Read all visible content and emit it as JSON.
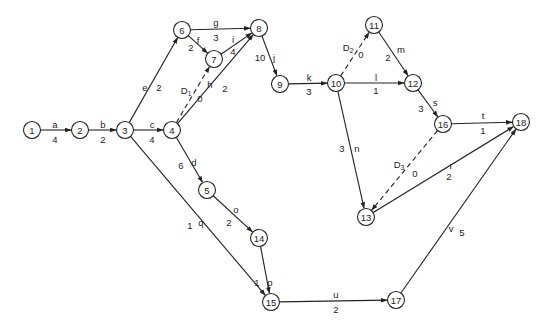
{
  "diagram": {
    "type": "activity-on-arrow network",
    "nodes": [
      {
        "id": "1",
        "label": "1",
        "x": 32,
        "y": 130
      },
      {
        "id": "2",
        "label": "2",
        "x": 80,
        "y": 130
      },
      {
        "id": "3",
        "label": "3",
        "x": 125,
        "y": 130
      },
      {
        "id": "4",
        "label": "4",
        "x": 172,
        "y": 130
      },
      {
        "id": "5",
        "label": "5",
        "x": 207,
        "y": 190
      },
      {
        "id": "6",
        "label": "6",
        "x": 182,
        "y": 30
      },
      {
        "id": "7",
        "label": "7",
        "x": 214,
        "y": 59
      },
      {
        "id": "8",
        "label": "8",
        "x": 259,
        "y": 28
      },
      {
        "id": "9",
        "label": "9",
        "x": 280,
        "y": 84
      },
      {
        "id": "10",
        "label": "10",
        "x": 336,
        "y": 83
      },
      {
        "id": "11",
        "label": "11",
        "x": 374,
        "y": 25
      },
      {
        "id": "12",
        "label": "12",
        "x": 413,
        "y": 83
      },
      {
        "id": "13",
        "label": "13",
        "x": 366,
        "y": 217
      },
      {
        "id": "14",
        "label": "14",
        "x": 259,
        "y": 238
      },
      {
        "id": "15",
        "label": "15",
        "x": 271,
        "y": 302
      },
      {
        "id": "16",
        "label": "16",
        "x": 443,
        "y": 124
      },
      {
        "id": "17",
        "label": "17",
        "x": 396,
        "y": 300
      },
      {
        "id": "18",
        "label": "18",
        "x": 521,
        "y": 122
      }
    ],
    "edges": [
      {
        "from": "1",
        "to": "2",
        "activity": "a",
        "duration": "4",
        "dummy": false,
        "ax": 55,
        "ay": 124,
        "dx": 55,
        "dy": 139
      },
      {
        "from": "2",
        "to": "3",
        "activity": "b",
        "duration": "2",
        "dummy": false,
        "ax": 103,
        "ay": 124,
        "dx": 103,
        "dy": 139
      },
      {
        "from": "3",
        "to": "4",
        "activity": "c",
        "duration": "4",
        "dummy": false,
        "ax": 152,
        "ay": 124,
        "dx": 152,
        "dy": 139
      },
      {
        "from": "4",
        "to": "5",
        "activity": "d",
        "duration": "6",
        "dummy": false,
        "ax": 194,
        "ay": 162,
        "dx": 181,
        "dy": 165
      },
      {
        "from": "3",
        "to": "6",
        "activity": "e",
        "duration": "2",
        "dummy": false,
        "ax": 145,
        "ay": 87,
        "dx": 159,
        "dy": 87
      },
      {
        "from": "6",
        "to": "7",
        "activity": "f",
        "duration": "2",
        "dummy": false,
        "ax": 198,
        "ay": 40,
        "dx": 191,
        "dy": 47
      },
      {
        "from": "6",
        "to": "8",
        "activity": "g",
        "duration": "3",
        "dummy": false,
        "ax": 216,
        "ay": 22,
        "dx": 216,
        "dy": 37
      },
      {
        "from": "4",
        "to": "8",
        "activity": "h",
        "duration": "2",
        "dummy": false,
        "ax": 210,
        "ay": 84,
        "dx": 225,
        "dy": 88
      },
      {
        "from": "7",
        "to": "8",
        "activity": "i",
        "duration": "4",
        "dummy": false,
        "ax": 233,
        "ay": 39,
        "dx": 233,
        "dy": 51
      },
      {
        "from": "8",
        "to": "9",
        "activity": "j",
        "duration": "10",
        "dummy": false,
        "ax": 274,
        "ay": 57,
        "dx": 260,
        "dy": 57
      },
      {
        "from": "9",
        "to": "10",
        "activity": "k",
        "duration": "3",
        "dummy": false,
        "ax": 309,
        "ay": 77,
        "dx": 309,
        "dy": 91
      },
      {
        "from": "10",
        "to": "12",
        "activity": "l",
        "duration": "1",
        "dummy": false,
        "ax": 376,
        "ay": 77,
        "dx": 376,
        "dy": 90
      },
      {
        "from": "11",
        "to": "12",
        "activity": "m",
        "duration": "2",
        "dummy": false,
        "ax": 401,
        "ay": 49,
        "dx": 388,
        "dy": 57
      },
      {
        "from": "10",
        "to": "13",
        "activity": "n",
        "duration": "3",
        "dummy": false,
        "ax": 357,
        "ay": 148,
        "dx": 342,
        "dy": 148
      },
      {
        "from": "5",
        "to": "14",
        "activity": "o",
        "duration": "2",
        "dummy": false,
        "ax": 236,
        "ay": 209,
        "dx": 229,
        "dy": 222
      },
      {
        "from": "14",
        "to": "15",
        "activity": "p",
        "duration": "1",
        "dummy": false,
        "ax": 270,
        "ay": 282,
        "dx": 257,
        "dy": 282
      },
      {
        "from": "3",
        "to": "15",
        "activity": "q",
        "duration": "1",
        "dummy": false,
        "ax": 201,
        "ay": 222,
        "dx": 190,
        "dy": 225
      },
      {
        "from": "13",
        "to": "18",
        "activity": "r",
        "duration": "2",
        "dummy": false,
        "ax": 451,
        "ay": 165,
        "dx": 449,
        "dy": 176
      },
      {
        "from": "12",
        "to": "16",
        "activity": "s",
        "duration": "3",
        "dummy": false,
        "ax": 435,
        "ay": 102,
        "dx": 421,
        "dy": 108
      },
      {
        "from": "16",
        "to": "18",
        "activity": "t",
        "duration": "1",
        "dummy": false,
        "ax": 483,
        "ay": 115,
        "dx": 483,
        "dy": 130
      },
      {
        "from": "15",
        "to": "17",
        "activity": "u",
        "duration": "2",
        "dummy": false,
        "ax": 336,
        "ay": 294,
        "dx": 336,
        "dy": 309
      },
      {
        "from": "17",
        "to": "18",
        "activity": "v",
        "duration": "5",
        "dummy": false,
        "ax": 451,
        "ay": 228,
        "dx": 462,
        "dy": 232
      },
      {
        "from": "4",
        "to": "7",
        "activity": "D",
        "sub": "1",
        "duration": "0",
        "dummy": true,
        "ax": 186,
        "ay": 90,
        "dx": 200,
        "dy": 98
      },
      {
        "from": "10",
        "to": "11",
        "activity": "D",
        "sub": "2",
        "duration": "0",
        "dummy": true,
        "ax": 348,
        "ay": 47,
        "dx": 361,
        "dy": 54
      },
      {
        "from": "16",
        "to": "13",
        "activity": "D",
        "sub": "3",
        "duration": "0",
        "dummy": true,
        "ax": 399,
        "ay": 164,
        "dx": 415,
        "dy": 173
      }
    ]
  }
}
